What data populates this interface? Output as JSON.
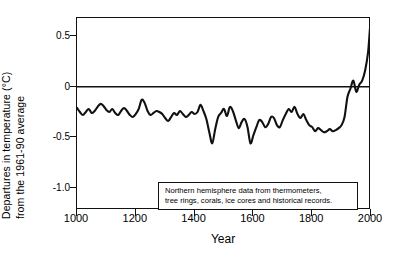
{
  "chart_data": {
    "type": "line",
    "title": "",
    "xlabel": "Year",
    "ylabel_line_1": "Departures in temperature (°C)",
    "ylabel_line_2": "from the 1961-90 average",
    "xlim": [
      1000,
      2000
    ],
    "ylim": [
      -1.22,
      0.68
    ],
    "grid": false,
    "legend": null,
    "xticks": [
      1000,
      1200,
      1400,
      1600,
      1800,
      2000
    ],
    "xtick_labels": [
      "1000",
      "1200",
      "1400",
      "1600",
      "1800",
      "2000"
    ],
    "yticks": [
      0.5,
      0,
      -0.5,
      -1.0
    ],
    "ytick_labels": [
      "0.5",
      "0",
      "-0.5",
      "-1.0"
    ],
    "zero_line": 0,
    "series_name": "Northern hemisphere temperature anomaly",
    "line_color": "#111111",
    "annotation": {
      "line_1": "Northern hemisphere data from thermometers,",
      "line_2": "tree rings, corals, ice cores and historical records."
    },
    "x": [
      1000,
      1010,
      1020,
      1030,
      1040,
      1050,
      1060,
      1070,
      1080,
      1090,
      1100,
      1110,
      1120,
      1130,
      1140,
      1150,
      1160,
      1170,
      1180,
      1190,
      1200,
      1210,
      1220,
      1230,
      1240,
      1250,
      1260,
      1270,
      1280,
      1290,
      1300,
      1310,
      1320,
      1330,
      1340,
      1350,
      1360,
      1370,
      1380,
      1390,
      1400,
      1410,
      1420,
      1430,
      1440,
      1450,
      1460,
      1470,
      1480,
      1490,
      1500,
      1510,
      1520,
      1530,
      1540,
      1550,
      1560,
      1570,
      1580,
      1590,
      1600,
      1610,
      1620,
      1630,
      1640,
      1650,
      1660,
      1670,
      1680,
      1690,
      1700,
      1710,
      1720,
      1730,
      1740,
      1750,
      1760,
      1770,
      1780,
      1790,
      1800,
      1810,
      1820,
      1830,
      1840,
      1850,
      1860,
      1870,
      1880,
      1890,
      1900,
      1910,
      1920,
      1930,
      1940,
      1950,
      1960,
      1970,
      1980,
      1990,
      1998,
      2000
    ],
    "values": [
      -0.21,
      -0.25,
      -0.28,
      -0.25,
      -0.22,
      -0.26,
      -0.24,
      -0.2,
      -0.17,
      -0.19,
      -0.23,
      -0.25,
      -0.22,
      -0.26,
      -0.28,
      -0.24,
      -0.21,
      -0.24,
      -0.28,
      -0.3,
      -0.27,
      -0.22,
      -0.13,
      -0.16,
      -0.24,
      -0.28,
      -0.26,
      -0.24,
      -0.25,
      -0.27,
      -0.31,
      -0.34,
      -0.3,
      -0.26,
      -0.28,
      -0.24,
      -0.27,
      -0.3,
      -0.28,
      -0.25,
      -0.27,
      -0.25,
      -0.18,
      -0.24,
      -0.32,
      -0.45,
      -0.56,
      -0.42,
      -0.3,
      -0.26,
      -0.22,
      -0.29,
      -0.2,
      -0.24,
      -0.33,
      -0.41,
      -0.35,
      -0.32,
      -0.4,
      -0.56,
      -0.48,
      -0.4,
      -0.33,
      -0.35,
      -0.4,
      -0.37,
      -0.3,
      -0.31,
      -0.38,
      -0.4,
      -0.33,
      -0.27,
      -0.22,
      -0.25,
      -0.2,
      -0.27,
      -0.31,
      -0.27,
      -0.33,
      -0.38,
      -0.4,
      -0.44,
      -0.41,
      -0.43,
      -0.45,
      -0.44,
      -0.42,
      -0.44,
      -0.43,
      -0.41,
      -0.38,
      -0.3,
      -0.1,
      -0.02,
      0.06,
      -0.05,
      0.02,
      0.06,
      0.16,
      0.34,
      0.62,
      0.5
    ]
  }
}
